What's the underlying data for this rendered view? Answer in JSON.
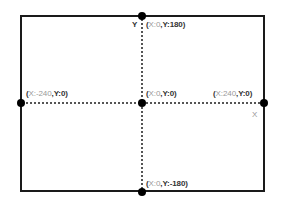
{
  "diagram": {
    "title": "",
    "axes": {
      "x_label": "X",
      "y_label": "Y"
    },
    "points": [
      {
        "id": "top",
        "x": 0,
        "y": 180,
        "label_open": "(",
        "label_x": "X:0",
        "label_sep": ",",
        "label_y": "Y:180)"
      },
      {
        "id": "left",
        "x": -240,
        "y": 0,
        "label_open": "(",
        "label_x": "X:-240",
        "label_sep": ",",
        "label_y": "Y:0)"
      },
      {
        "id": "center",
        "x": 0,
        "y": 0,
        "label_open": "(",
        "label_x": "X:0",
        "label_sep": ",",
        "label_y": "Y:0)"
      },
      {
        "id": "right",
        "x": 240,
        "y": 0,
        "label_open": "(",
        "label_x": "X:240",
        "label_sep": ",",
        "label_y": "Y:0)"
      },
      {
        "id": "bottom",
        "x": 0,
        "y": -180,
        "label_open": "(",
        "label_x": "X:0",
        "label_sep": ",",
        "label_y": "Y:-180)"
      }
    ],
    "colors": {
      "frame": "#1a1a1a",
      "gridline": "#555555",
      "dot": "#000000",
      "label_dark": "#333333",
      "label_muted": "#999999"
    }
  }
}
